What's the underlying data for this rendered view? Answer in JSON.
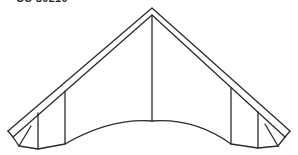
{
  "figure": {
    "label": "CU 80210"
  },
  "colors": {
    "line": "#2b2b2b",
    "background": "#ffffff"
  }
}
